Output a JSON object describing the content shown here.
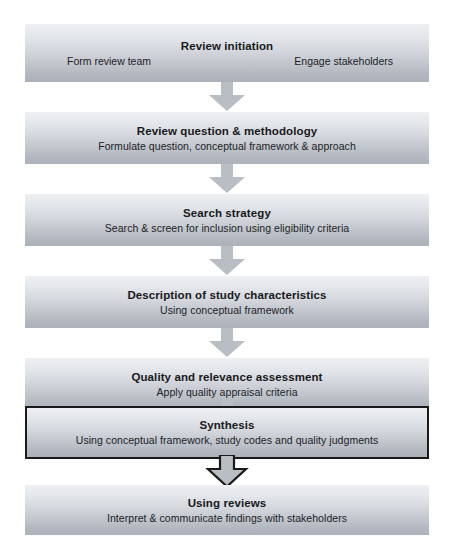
{
  "diagram": {
    "orientation": "vertical-top-to-bottom",
    "colors": {
      "box_gradient_top": "#eef0f3",
      "box_gradient_bottom": "#adb2ba",
      "arrow_fill": "#b9bdc4",
      "highlight_border": "#1a1a1a",
      "text": "#18191b",
      "background": "#ffffff"
    },
    "stages": [
      {
        "id": "review-initiation",
        "title": "Review initiation",
        "left_label": "Form review team",
        "right_label": "Engage stakeholders",
        "highlighted": false
      },
      {
        "id": "review-question-methodology",
        "title": "Review question & methodology",
        "subtitle": "Formulate question, conceptual framework & approach",
        "highlighted": false
      },
      {
        "id": "search-strategy",
        "title": "Search strategy",
        "subtitle": "Search & screen for inclusion using eligibility criteria",
        "highlighted": false
      },
      {
        "id": "description-of-study-characteristics",
        "title": "Description of study characteristics",
        "subtitle": "Using conceptual framework",
        "highlighted": false
      },
      {
        "id": "quality-and-relevance-assessment",
        "title": "Quality and relevance assessment",
        "subtitle": "Apply quality appraisal criteria",
        "highlighted": false
      },
      {
        "id": "synthesis",
        "title": "Synthesis",
        "subtitle": "Using conceptual framework, study codes and quality judgments",
        "highlighted": true
      },
      {
        "id": "using-reviews",
        "title": "Using reviews",
        "subtitle": "Interpret & communicate findings with stakeholders",
        "highlighted": false
      }
    ],
    "connectors": [
      {
        "id": "connector-1",
        "from": "review-initiation",
        "to": "review-question-methodology",
        "outlined": false
      },
      {
        "id": "connector-2",
        "from": "review-question-methodology",
        "to": "search-strategy",
        "outlined": false
      },
      {
        "id": "connector-3",
        "from": "search-strategy",
        "to": "description-of-study-characteristics",
        "outlined": false
      },
      {
        "id": "connector-4",
        "from": "description-of-study-characteristics",
        "to": "quality-and-relevance-assessment",
        "outlined": false
      },
      {
        "id": "connector-5",
        "from": "quality-and-relevance-assessment",
        "to": "synthesis",
        "outlined": false
      },
      {
        "id": "connector-6",
        "from": "synthesis",
        "to": "using-reviews",
        "outlined": true
      }
    ]
  }
}
